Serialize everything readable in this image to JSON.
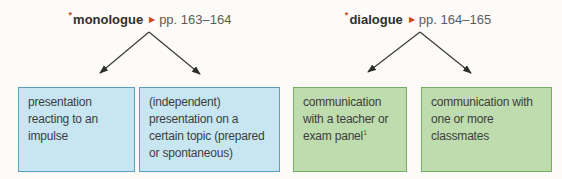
{
  "diagram": {
    "background_color": "#fcfbf8",
    "arrow_color": "#3a3a3a",
    "accent_red": "#c8431f",
    "trees": [
      {
        "asterisk": "*",
        "term": "monologue",
        "ref_icon": "▶",
        "pages": "pp. 163–164",
        "box_fill": "#c7e6f2",
        "box_border": "#5a9fbb",
        "children": [
          {
            "text": "presentation reacting to an impulse",
            "superscript": ""
          },
          {
            "text": "(independent) presentation on a certain topic (prepared or spontaneous)",
            "superscript": ""
          }
        ]
      },
      {
        "asterisk": "*",
        "term": "dialogue",
        "ref_icon": "▶",
        "pages": "pp. 164–165",
        "box_fill": "#bedcad",
        "box_border": "#74af68",
        "children": [
          {
            "text": "communication with a teacher or exam panel",
            "superscript": "1"
          },
          {
            "text": "communication with one or more classmates",
            "superscript": ""
          }
        ]
      }
    ]
  }
}
